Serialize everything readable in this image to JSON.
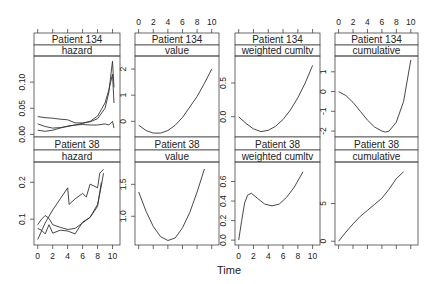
{
  "chart_data": {
    "type": "line",
    "layout": "lattice 4 columns x 2 rows",
    "xlabel": "Time",
    "x_ticks": [
      0,
      2,
      4,
      6,
      8,
      10
    ],
    "xlim": [
      -0.5,
      11
    ],
    "panels": [
      {
        "patient": "Patient 134",
        "variable": "hazard",
        "row": 0,
        "col": 0,
        "ylim": [
          -0.005,
          0.15
        ],
        "y_ticks": [
          0.0,
          0.05,
          0.1
        ],
        "y_tick_labels": [
          "0.00",
          "0.05",
          "0.10"
        ],
        "series": [
          {
            "name": "line1",
            "x": [
              0,
              1,
              2,
              3,
              4,
              5,
              6,
              7,
              8,
              9,
              9.5,
              10,
              10.2
            ],
            "y": [
              0.034,
              0.032,
              0.031,
              0.029,
              0.028,
              0.022,
              0.022,
              0.024,
              0.03,
              0.05,
              0.08,
              0.14,
              0.09
            ]
          },
          {
            "name": "line2",
            "x": [
              0,
              1,
              2,
              3,
              4,
              5,
              6,
              7,
              8,
              9,
              9.5,
              10,
              10.2
            ],
            "y": [
              0.02,
              0.015,
              0.012,
              0.013,
              0.015,
              0.018,
              0.021,
              0.025,
              0.035,
              0.06,
              0.085,
              0.115,
              0.06
            ]
          },
          {
            "name": "line3",
            "x": [
              0,
              1,
              2,
              3,
              4,
              5,
              6,
              7,
              8,
              9,
              9.5,
              10,
              10.2
            ],
            "y": [
              0.008,
              0.006,
              0.008,
              0.012,
              0.016,
              0.018,
              0.019,
              0.018,
              0.018,
              0.02,
              0.018,
              0.025,
              0.012
            ]
          }
        ]
      },
      {
        "patient": "Patient 134",
        "variable": "value",
        "row": 0,
        "col": 1,
        "ylim": [
          -0.6,
          2.5
        ],
        "y_ticks": [
          0,
          1,
          2
        ],
        "y_tick_labels": [
          "0",
          "1",
          "2"
        ],
        "series": [
          {
            "name": "value",
            "x": [
              0,
              1,
              2,
              3,
              4,
              5,
              6,
              7,
              8,
              9,
              10
            ],
            "y": [
              -0.15,
              -0.35,
              -0.45,
              -0.45,
              -0.35,
              -0.15,
              0.15,
              0.55,
              0.95,
              1.45,
              2.0
            ]
          }
        ]
      },
      {
        "patient": "Patient 134",
        "variable": "weighted cumltv",
        "row": 0,
        "col": 2,
        "ylim": [
          -0.3,
          0.9
        ],
        "y_ticks": [
          0.0,
          0.5
        ],
        "y_tick_labels": [
          "0.0",
          "0.5"
        ],
        "series": [
          {
            "name": "weighted cumltv",
            "x": [
              0,
              1,
              2,
              3,
              4,
              5,
              6,
              7,
              8,
              9,
              10
            ],
            "y": [
              0.0,
              -0.1,
              -0.18,
              -0.22,
              -0.2,
              -0.14,
              -0.04,
              0.1,
              0.28,
              0.5,
              0.76
            ]
          }
        ]
      },
      {
        "patient": "Patient 134",
        "variable": "cumulative",
        "row": 0,
        "col": 3,
        "ylim": [
          -2.3,
          1.8
        ],
        "y_ticks": [
          -2,
          -1,
          0,
          1
        ],
        "y_tick_labels": [
          "-2",
          "-1",
          "0",
          "1"
        ],
        "series": [
          {
            "name": "cumulative",
            "x": [
              0,
              1,
              2,
              3,
              4,
              5,
              6,
              6.5,
              7,
              8,
              9,
              10
            ],
            "y": [
              0.0,
              -0.2,
              -0.55,
              -1.0,
              -1.45,
              -1.8,
              -2.0,
              -2.05,
              -2.0,
              -1.55,
              -0.5,
              1.6
            ]
          }
        ]
      },
      {
        "patient": "Patient 38",
        "variable": "hazard",
        "row": 1,
        "col": 0,
        "ylim": [
          0.03,
          0.255
        ],
        "y_ticks": [
          0.1,
          0.2
        ],
        "y_tick_labels": [
          "0.1",
          "0.2"
        ],
        "series": [
          {
            "name": "line1",
            "x": [
              0,
              1,
              2,
              3,
              4,
              4.2,
              5,
              6,
              6.5,
              7,
              8,
              8.3,
              8.8
            ],
            "y": [
              0.045,
              0.09,
              0.125,
              0.155,
              0.185,
              0.14,
              0.155,
              0.17,
              0.16,
              0.195,
              0.185,
              0.225,
              0.235
            ]
          },
          {
            "name": "line2",
            "x": [
              0,
              0.5,
              1,
              1.5,
              2,
              3,
              4,
              5,
              6,
              7,
              8,
              8.5,
              8.8
            ],
            "y": [
              0.085,
              0.1,
              0.11,
              0.102,
              0.085,
              0.078,
              0.072,
              0.075,
              0.09,
              0.105,
              0.14,
              0.19,
              0.225
            ]
          },
          {
            "name": "line3",
            "x": [
              0,
              0.5,
              1,
              1.5,
              2,
              3,
              4,
              5,
              6,
              7,
              8,
              8.5
            ],
            "y": [
              0.075,
              0.07,
              0.06,
              0.085,
              0.062,
              0.07,
              0.068,
              0.06,
              0.092,
              0.105,
              0.135,
              0.2
            ]
          }
        ]
      },
      {
        "patient": "Patient 38",
        "variable": "value",
        "row": 1,
        "col": 1,
        "ylim": [
          0.55,
          1.85
        ],
        "y_ticks": [
          1.0,
          1.5
        ],
        "y_tick_labels": [
          "1.0",
          "1.5"
        ],
        "series": [
          {
            "name": "value",
            "x": [
              0,
              1,
              2,
              3,
              4,
              5,
              6,
              7,
              8,
              9
            ],
            "y": [
              1.38,
              1.08,
              0.84,
              0.68,
              0.62,
              0.66,
              0.82,
              1.06,
              1.38,
              1.74
            ]
          }
        ]
      },
      {
        "patient": "Patient 38",
        "variable": "weighted cumltv",
        "row": 1,
        "col": 2,
        "ylim": [
          -0.05,
          0.8
        ],
        "y_ticks": [
          0.0,
          0.2,
          0.4,
          0.6
        ],
        "y_tick_labels": [
          "0.0",
          "0.2",
          "0.4",
          "0.6"
        ],
        "series": [
          {
            "name": "weighted cumltv",
            "x": [
              0,
              0.4,
              0.8,
              1.2,
              1.7,
              2.5,
              3.5,
              4.5,
              5.5,
              6.5,
              7.5,
              8.7
            ],
            "y": [
              0.0,
              0.2,
              0.38,
              0.46,
              0.48,
              0.43,
              0.37,
              0.35,
              0.37,
              0.44,
              0.54,
              0.7
            ]
          }
        ]
      },
      {
        "patient": "Patient 38",
        "variable": "cumulative",
        "row": 1,
        "col": 3,
        "ylim": [
          -0.5,
          10.5
        ],
        "y_ticks": [
          0,
          5
        ],
        "y_tick_labels": [
          "0",
          "5"
        ],
        "series": [
          {
            "name": "cumulative",
            "x": [
              0,
              1,
              2,
              3,
              4,
              5,
              6,
              7,
              8,
              9
            ],
            "y": [
              0.0,
              1.2,
              2.3,
              3.3,
              4.1,
              4.9,
              5.7,
              6.9,
              8.3,
              9.2
            ]
          }
        ]
      }
    ]
  }
}
